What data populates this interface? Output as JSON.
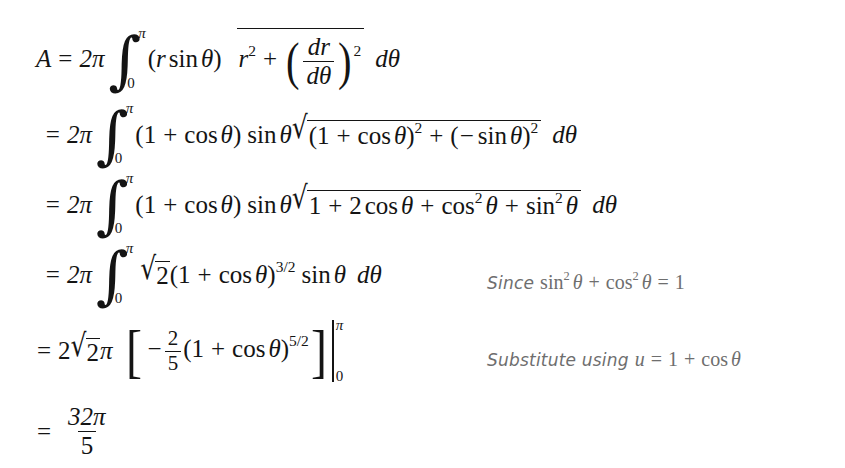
{
  "document": {
    "type": "calculus-derivation",
    "subject": "Surface area of revolution of the cardioid r = 1 + cos(theta)",
    "result": "32pi/5",
    "text_color": "#141414",
    "annotation_color": "#6e6e6e",
    "background_color": "#ffffff"
  },
  "equation": {
    "lines": [
      {
        "id": "line-1",
        "lhs": "A =",
        "coefficient": "2π",
        "integral": {
          "lower": "0",
          "upper": "π"
        },
        "integrand": "(r sin θ)√(r² + (dr/dθ)²)",
        "differential": "dθ",
        "plain": "A = 2π ∫₀^π (r sin θ)√(r² + (dr/dθ)²) dθ",
        "annotation": null
      },
      {
        "id": "line-2",
        "lhs": "=",
        "coefficient": "2π",
        "integral": {
          "lower": "0",
          "upper": "π"
        },
        "integrand": "(1 + cos θ) sin θ √((1 + cos θ)² + (− sin θ)²)",
        "differential": "dθ",
        "plain": "= 2π ∫₀^π (1 + cos θ) sin θ √((1 + cos θ)² + (−sin θ)²) dθ",
        "annotation": null
      },
      {
        "id": "line-3",
        "lhs": "=",
        "coefficient": "2π",
        "integral": {
          "lower": "0",
          "upper": "π"
        },
        "integrand": "(1 + cos θ) sin θ √(1 + 2 cos θ + cos² θ + sin² θ)",
        "differential": "dθ",
        "plain": "= 2π ∫₀^π (1 + cos θ) sin θ √(1 + 2cos θ + cos² θ + sin² θ) dθ",
        "annotation": null
      },
      {
        "id": "line-4",
        "lhs": "=",
        "coefficient": "2π",
        "integral": {
          "lower": "0",
          "upper": "π"
        },
        "integrand": "√2 (1 + cos θ)^(3/2) sin θ",
        "differential": "dθ",
        "plain": "= 2π ∫₀^π √2(1 + cos θ)^{3/2} sin θ dθ",
        "annotation": "annotation-1"
      },
      {
        "id": "line-5",
        "lhs": "=",
        "coefficient": "2√2π",
        "bracket_body": "−(2/5)(1 + cos θ)^(5/2)",
        "eval_limits": {
          "lower": "0",
          "upper": "π"
        },
        "plain": "= 2√2π [ −(2/5)(1 + cos θ)^{5/2} ] ∣₀^π",
        "annotation": "annotation-2"
      },
      {
        "id": "line-6",
        "lhs": "=",
        "fraction": {
          "numerator": "32π",
          "denominator": "5"
        },
        "plain": "= 32π/5",
        "annotation": null
      }
    ],
    "symbols": {
      "area": "A",
      "two_pi": "2π",
      "radius": "r",
      "theta": "θ",
      "d_theta": "dθ",
      "dr": "dr",
      "one": "1",
      "two": "2",
      "five": "5",
      "sqrt_two": "√2",
      "exp_two": "2",
      "exp_three_halves": "3/2",
      "exp_five_halves": "5/2",
      "limit_lower": "0",
      "limit_upper": "π",
      "numerator_32pi": "32π",
      "denominator_5": "5",
      "minus": "−",
      "plus": "+",
      "equals": "=",
      "sin": "sin",
      "cos": "cos"
    }
  },
  "annotations": [
    {
      "id": "annotation-1",
      "lead_word": "Since",
      "math": "sin² θ + cos² θ = 1",
      "parts": {
        "sin": "sin",
        "sin_exp": "2",
        "theta_1": "θ",
        "plus": "+",
        "cos": "cos",
        "cos_exp": "2",
        "theta_2": "θ",
        "equals": "=",
        "one": "1"
      }
    },
    {
      "id": "annotation-2",
      "lead_word": "Substitute using",
      "math": "u = 1 + cos θ",
      "parts": {
        "u": "u",
        "equals": "=",
        "one": "1",
        "plus": "+",
        "cos": "cos",
        "theta": "θ"
      }
    }
  ]
}
